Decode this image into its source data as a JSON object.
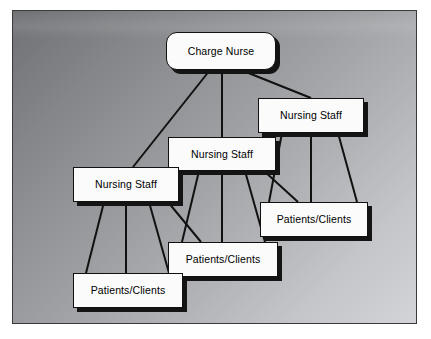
{
  "figure": {
    "type": "organizational-hierarchy-diagram",
    "frame": {
      "border_color": "#3a3a3a",
      "background_gradient_from": "#6f7174",
      "background_gradient_to": "#d2d4d7"
    },
    "node_style": {
      "fill": "#fbfbfb",
      "border_color": "#111111",
      "shadow_color": "#141414"
    },
    "connector_style": {
      "color": "#111111",
      "width": 2
    }
  },
  "nodes": [
    {
      "id": "charge-nurse",
      "label": "Charge Nurse",
      "role": "root",
      "shape": "rounded-rect",
      "x": 153,
      "y": 21,
      "w": 110,
      "h": 38
    },
    {
      "id": "nursing-staff-right",
      "label": "Nursing Staff",
      "role": "level2",
      "shape": "rect",
      "x": 245,
      "y": 87,
      "w": 106,
      "h": 35
    },
    {
      "id": "nursing-staff-mid",
      "label": "Nursing Staff",
      "role": "level2",
      "shape": "rect",
      "x": 155,
      "y": 126,
      "w": 108,
      "h": 34
    },
    {
      "id": "nursing-staff-left",
      "label": "Nursing Staff",
      "role": "level2",
      "shape": "rect",
      "x": 60,
      "y": 156,
      "w": 106,
      "h": 35
    },
    {
      "id": "patients-right",
      "label": "Patients/Clients",
      "role": "level3",
      "shape": "rect",
      "x": 247,
      "y": 191,
      "w": 108,
      "h": 35
    },
    {
      "id": "patients-mid",
      "label": "Patients/Clients",
      "role": "level3",
      "shape": "rect",
      "x": 155,
      "y": 231,
      "w": 110,
      "h": 35
    },
    {
      "id": "patients-left",
      "label": "Patients/Clients",
      "role": "level3",
      "shape": "rect",
      "x": 60,
      "y": 262,
      "w": 110,
      "h": 35
    }
  ],
  "edges": [
    {
      "from": "charge-nurse",
      "to": "nursing-staff-left",
      "x1": 197,
      "y1": 59,
      "x2": 120,
      "y2": 156
    },
    {
      "from": "charge-nurse",
      "to": "nursing-staff-mid",
      "x1": 209,
      "y1": 59,
      "x2": 209,
      "y2": 126
    },
    {
      "from": "charge-nurse",
      "to": "nursing-staff-right",
      "x1": 228,
      "y1": 59,
      "x2": 298,
      "y2": 87
    },
    {
      "from": "nursing-staff-right",
      "to": "patients-right",
      "x1": 269,
      "y1": 122,
      "x2": 256,
      "y2": 191
    },
    {
      "from": "nursing-staff-right",
      "to": "patients-right",
      "x1": 298,
      "y1": 122,
      "x2": 298,
      "y2": 191
    },
    {
      "from": "nursing-staff-right",
      "to": "patients-right",
      "x1": 325,
      "y1": 122,
      "x2": 344,
      "y2": 191
    },
    {
      "from": "nursing-staff-mid",
      "to": "patients-mid",
      "x1": 186,
      "y1": 160,
      "x2": 169,
      "y2": 231
    },
    {
      "from": "nursing-staff-mid",
      "to": "patients-mid",
      "x1": 209,
      "y1": 160,
      "x2": 209,
      "y2": 231
    },
    {
      "from": "nursing-staff-mid",
      "to": "patients-mid",
      "x1": 232,
      "y1": 160,
      "x2": 252,
      "y2": 231
    },
    {
      "from": "nursing-staff-mid",
      "to": "patients-right",
      "x1": 251,
      "y1": 160,
      "x2": 285,
      "y2": 191
    },
    {
      "from": "nursing-staff-left",
      "to": "patients-left",
      "x1": 91,
      "y1": 191,
      "x2": 73,
      "y2": 262
    },
    {
      "from": "nursing-staff-left",
      "to": "patients-left",
      "x1": 113,
      "y1": 191,
      "x2": 113,
      "y2": 262
    },
    {
      "from": "nursing-staff-left",
      "to": "patients-left",
      "x1": 136,
      "y1": 191,
      "x2": 156,
      "y2": 262
    },
    {
      "from": "nursing-staff-left",
      "to": "patients-mid",
      "x1": 155,
      "y1": 191,
      "x2": 188,
      "y2": 231
    }
  ]
}
